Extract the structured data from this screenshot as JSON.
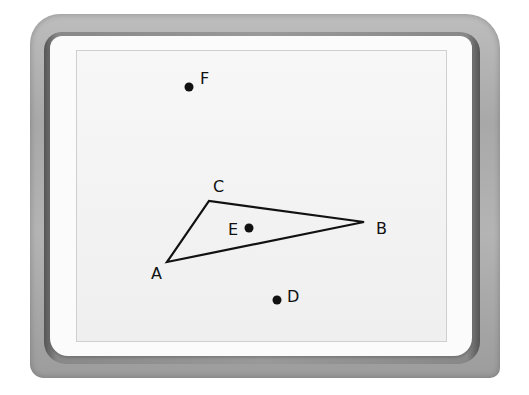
{
  "diagram": {
    "type": "geometry",
    "colors": {
      "bezel": "#aaaaaa",
      "frame": "#fbfbfb",
      "screen": "#f2f2f2",
      "ink": "#111111"
    },
    "triangle": {
      "vertices": [
        "A",
        "B",
        "C"
      ]
    },
    "points": {
      "A": {
        "label": "A",
        "x": 167,
        "y": 262
      },
      "B": {
        "label": "B",
        "x": 364,
        "y": 222
      },
      "C": {
        "label": "C",
        "x": 209,
        "y": 201
      },
      "D": {
        "label": "D",
        "x": 277,
        "y": 299
      },
      "E": {
        "label": "E",
        "x": 248,
        "y": 228
      },
      "F": {
        "label": "F",
        "x": 189,
        "y": 87
      }
    }
  }
}
